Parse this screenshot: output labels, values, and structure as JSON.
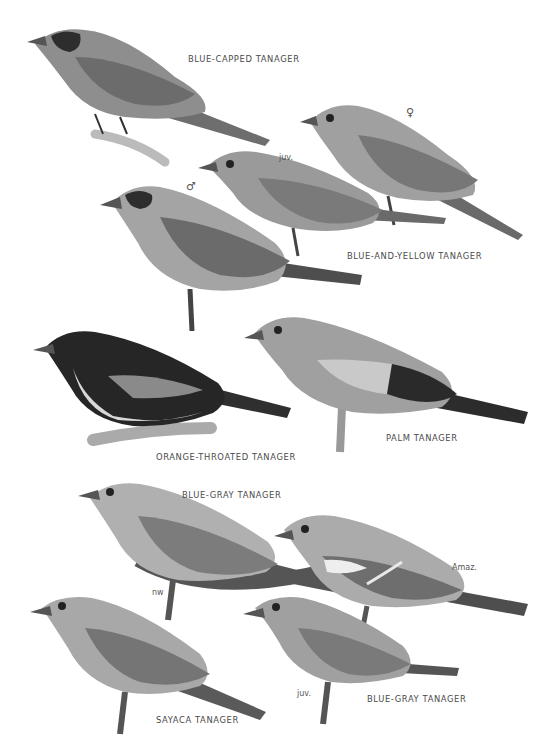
{
  "plate": {
    "style": "grayscale field-guide illustration plate",
    "species_labels": [
      {
        "id": "blue-capped",
        "text": "BLUE-CAPPED TANAGER"
      },
      {
        "id": "blue-and-yellow",
        "text": "BLUE-AND-YELLOW TANAGER"
      },
      {
        "id": "orange-throated",
        "text": "ORANGE-THROATED TANAGER"
      },
      {
        "id": "palm",
        "text": "PALM TANAGER"
      },
      {
        "id": "blue-gray-top",
        "text": "BLUE-GRAY TANAGER"
      },
      {
        "id": "blue-gray-bottom",
        "text": "BLUE-GRAY TANAGER"
      },
      {
        "id": "sayaca",
        "text": "SAYACA TANAGER"
      }
    ],
    "annotations": {
      "female_symbol": "♀",
      "male_symbol": "♂",
      "juv_1": "juv.",
      "juv_2": "juv.",
      "nw": "nw",
      "amaz": "Amaz."
    }
  }
}
